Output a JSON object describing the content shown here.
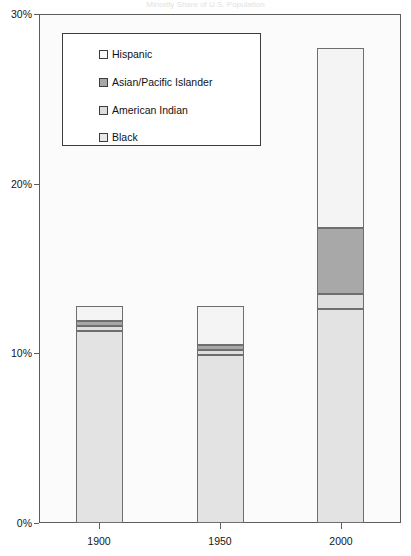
{
  "chart_data": {
    "type": "bar",
    "subtype": "stacked-bar",
    "title": "Minority Share of U.S. Population",
    "xlabel": "",
    "ylabel": "",
    "categories": [
      "1900",
      "1950",
      "2000"
    ],
    "ylim": [
      0,
      30
    ],
    "y_tick_values": [
      0,
      10,
      20,
      30
    ],
    "y_tick_labels": [
      "0%",
      "10%",
      "20%",
      "30%"
    ],
    "grid": false,
    "legend_position": "upper-left-inside",
    "series": [
      {
        "name": "Black",
        "color": "#e3e3e3",
        "values": [
          11.3,
          9.9,
          12.6
        ]
      },
      {
        "name": "American Indian",
        "color": "#dedede",
        "values": [
          0.3,
          0.3,
          0.9
        ]
      },
      {
        "name": "Asian/Pacific Islander",
        "color": "#a8a8a8",
        "values": [
          0.3,
          0.3,
          3.9
        ]
      },
      {
        "name": "Hispanic",
        "color": "#f4f4f4",
        "values": [
          0.9,
          2.3,
          10.6
        ]
      }
    ],
    "totals": [
      12.8,
      12.8,
      28.0
    ]
  },
  "legend": {
    "items": [
      {
        "label": "Hispanic",
        "swatch_color": "#fbfbfb"
      },
      {
        "label": "Asian/Pacific Islander",
        "swatch_color": "#a8a8a8"
      },
      {
        "label": "American Indian",
        "swatch_color": "#dcdcdc"
      },
      {
        "label": "Black",
        "swatch_color": "#e8e8e8"
      }
    ]
  },
  "axes": {
    "y_labels": [
      "30%",
      "20%",
      "10%",
      "0%"
    ],
    "x_labels": [
      "1900",
      "1950",
      "2000"
    ]
  },
  "colors": {
    "frame": "#5c5c5c",
    "bar_outline": "#6e6e6e",
    "plot_background": "#fbfbfb",
    "page_background": "#ffffff"
  }
}
